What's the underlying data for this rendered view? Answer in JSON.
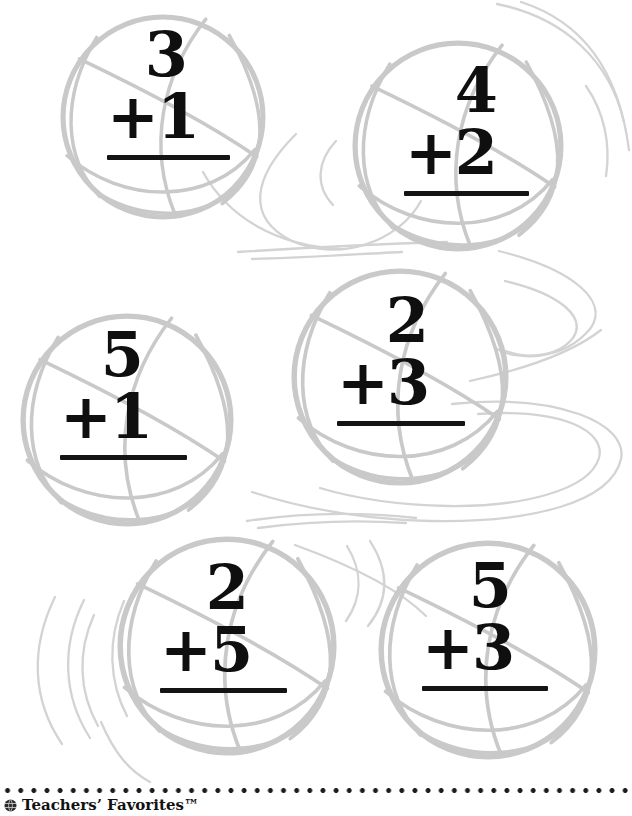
{
  "page": {
    "type": "math-worksheet",
    "theme": "basketball addition facts"
  },
  "colors": {
    "paper": "#ffffff",
    "ball_outline": "#c9c9c9",
    "swoosh": "#d3d3d3",
    "ink": "#0f0f0f"
  },
  "icons": {
    "basketball": "basketball-line-art-icon",
    "brand_seal": "brand-seal-icon"
  },
  "problems": [
    {
      "top": "3",
      "bottom": "+1"
    },
    {
      "top": "4",
      "bottom": "+2"
    },
    {
      "top": "5",
      "bottom": "+1"
    },
    {
      "top": "2",
      "bottom": "+3"
    },
    {
      "top": "2",
      "bottom": "+5"
    },
    {
      "top": "5",
      "bottom": "+3"
    }
  ],
  "footer": {
    "brand": "Teachers’ Favorites™"
  }
}
